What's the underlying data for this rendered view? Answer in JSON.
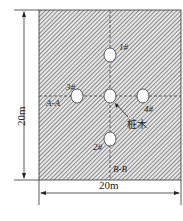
{
  "diagram": {
    "type": "plan-view",
    "dimensions": {
      "vertical": "20m",
      "horizontal": "20m"
    },
    "sections": {
      "horizontal": "A-A",
      "vertical": "B-B"
    },
    "holes": [
      {
        "id": "1",
        "label": "1#"
      },
      {
        "id": "2",
        "label": "2#"
      },
      {
        "id": "3",
        "label": "3#"
      },
      {
        "id": "4",
        "label": "4#"
      }
    ],
    "center_label": "桩木",
    "colors": {
      "hatch": "#555555",
      "background": "#ffffff",
      "line": "#222222"
    }
  }
}
